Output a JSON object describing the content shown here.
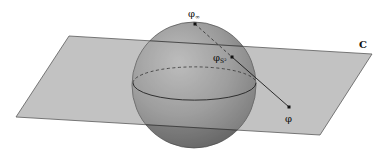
{
  "diagram": {
    "type": "stereographic-projection",
    "labels": {
      "plane": "C",
      "north_pole": "φ",
      "north_pole_sub": "∞",
      "sphere_point": "φ",
      "sphere_point_sub": "S²",
      "plane_point": "φ"
    },
    "colors": {
      "plane_fill": "#bdbdbd",
      "plane_edge": "#555555",
      "sphere_light": "#a8a8a8",
      "sphere_dark": "#6e6e6e",
      "line": "#222222",
      "point": "#111111"
    }
  }
}
